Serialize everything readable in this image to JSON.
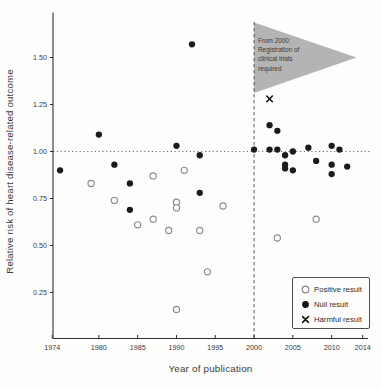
{
  "chart_data": {
    "type": "scatter",
    "title": "",
    "xlabel": "Year of publication",
    "ylabel": "Relative risk of heart disease-related outcome",
    "xlim": [
      1974,
      2014
    ],
    "ylim": [
      0.05,
      1.73
    ],
    "x_ticks": [
      1974,
      1980,
      1985,
      1990,
      1995,
      2000,
      2005,
      2010,
      2014
    ],
    "y_ticks": [
      0.25,
      0.5,
      0.75,
      1.0,
      1.25,
      1.5
    ],
    "grid": "off",
    "reference_lines": {
      "horizontal": {
        "y": 1.0,
        "style": "dotted"
      },
      "vertical": {
        "x": 2000,
        "style": "dashed"
      }
    },
    "series": [
      {
        "name": "Positive result",
        "marker": "open-circle",
        "color": "#8d8d8d",
        "points": [
          [
            1979,
            0.83
          ],
          [
            1982,
            0.74
          ],
          [
            1985,
            0.61
          ],
          [
            1987,
            0.87
          ],
          [
            1987,
            0.64
          ],
          [
            1989,
            0.58
          ],
          [
            1990,
            0.73
          ],
          [
            1990,
            0.7
          ],
          [
            1990,
            0.16
          ],
          [
            1991,
            0.9
          ],
          [
            1993,
            0.58
          ],
          [
            1994,
            0.36
          ],
          [
            1996,
            0.71
          ],
          [
            2003,
            0.54
          ],
          [
            2008,
            0.64
          ]
        ]
      },
      {
        "name": "Null result",
        "marker": "filled-circle",
        "color": "#1b1b1b",
        "points": [
          [
            1975,
            0.9
          ],
          [
            1980,
            1.09
          ],
          [
            1982,
            0.93
          ],
          [
            1984,
            0.83
          ],
          [
            1984,
            0.69
          ],
          [
            1990,
            1.03
          ],
          [
            1992,
            1.57
          ],
          [
            1993,
            0.98
          ],
          [
            1993,
            0.78
          ],
          [
            2000,
            1.01
          ],
          [
            2002,
            1.14
          ],
          [
            2002,
            1.01
          ],
          [
            2003,
            1.11
          ],
          [
            2003,
            1.01
          ],
          [
            2004,
            0.98
          ],
          [
            2004,
            0.93
          ],
          [
            2004,
            0.91
          ],
          [
            2005,
            1.0
          ],
          [
            2005,
            0.9
          ],
          [
            2007,
            1.02
          ],
          [
            2008,
            0.95
          ],
          [
            2010,
            1.03
          ],
          [
            2010,
            0.93
          ],
          [
            2010,
            0.88
          ],
          [
            2011,
            1.01
          ],
          [
            2012,
            0.92
          ]
        ]
      },
      {
        "name": "Harmful result",
        "marker": "x-cross",
        "color": "#111111",
        "points": [
          [
            2002,
            1.28
          ]
        ]
      }
    ],
    "annotation": {
      "shape": "right-pointing-triangle",
      "fill": "#b4b4b4",
      "lines": [
        "From 2000:",
        "Registration of",
        "clinical trials",
        "required"
      ]
    },
    "legend": {
      "position": "bottom-right",
      "entries": [
        {
          "label": "Positive result",
          "marker": "open-circle"
        },
        {
          "label": "Null result",
          "marker": "filled-circle"
        },
        {
          "label": "Harmful result",
          "marker": "x-cross"
        }
      ]
    }
  }
}
